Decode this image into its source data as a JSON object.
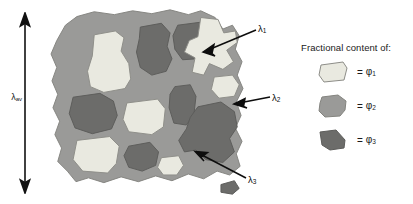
{
  "figure": {
    "type": "composite-microstructure-rve-diagram",
    "background_color": "#ffffff"
  },
  "scale_bar": {
    "name": "overall-length-scale",
    "label": "λ",
    "label_sub": "av",
    "orientation": "vertical",
    "arrowheads": "double"
  },
  "microstructure": {
    "matrix_label": "matrix-phase",
    "colors": {
      "matrix": "#9a9a98",
      "phase1_light": "#e9e9e0",
      "phase3_dark": "#6c6c6a",
      "outline": "#7f7f7d"
    },
    "outline_path": "M 22 20 L 34 11 L 52 6 L 73 9 L 92 5 L 112 8 L 131 4 L 150 9 L 163 5 L 178 12 L 186 24 L 196 20 L 203 31 L 199 45 L 206 58 L 201 72 L 207 86 L 200 100 L 205 114 L 199 127 L 206 141 L 200 154 L 204 167 L 193 176 L 180 172 L 166 180 L 150 175 L 133 182 L 116 177 L 98 183 L 80 178 L 62 184 L 46 179 L 33 183 L 24 172 L 14 162 L 18 148 L 11 134 L 16 120 L 9 106 L 14 92 L 8 78 L 13 64 L 7 50 L 13 36 Z",
    "inclusions": [
      {
        "name": "phase1-inclusion-top-left",
        "phase": 1,
        "path": "M 52 30 L 74 26 L 83 33 L 80 47 L 88 60 L 90 76 L 84 86 L 62 90 L 48 84 L 45 68 L 50 52 Z"
      },
      {
        "name": "phase3-inclusion-top-mid-left",
        "phase": 3,
        "path": "M 100 22 L 122 18 L 131 28 L 128 42 L 133 55 L 127 68 L 112 72 L 100 64 L 96 48 L 99 34 Z"
      },
      {
        "name": "phase3-inclusion-top-mid-right",
        "phase": 3,
        "path": "M 139 20 L 162 17 L 172 27 L 169 44 L 159 55 L 144 56 L 136 45 L 134 31 Z"
      },
      {
        "name": "phase1-inclusion-top-right-star",
        "phase": 1,
        "path": "M 163 12 L 181 14 L 187 28 L 199 26 L 201 38 L 190 46 L 197 58 L 186 66 L 172 60 L 166 72 L 154 69 L 157 54 L 146 48 L 151 36 L 160 32 Z"
      },
      {
        "name": "phase3-inclusion-mid-left",
        "phase": 3,
        "path": "M 30 95 L 58 91 L 72 99 L 76 114 L 70 128 L 50 133 L 32 127 L 26 112 Z"
      },
      {
        "name": "phase1-inclusion-mid-center",
        "phase": 1,
        "path": "M 86 101 L 118 97 L 126 107 L 124 126 L 112 134 L 88 131 L 82 118 Z"
      },
      {
        "name": "phase3-inclusion-mid-right",
        "phase": 3,
        "path": "M 136 84 L 152 82 L 158 94 L 156 112 L 148 124 L 135 122 L 130 106 L 131 92 Z"
      },
      {
        "name": "phase3-inclusion-large-bottom-right",
        "phase": 3,
        "path": "M 160 105 L 184 100 L 198 110 L 201 126 L 193 138 L 198 152 L 186 163 L 168 160 L 158 150 L 146 152 L 140 140 L 148 128 L 152 116 Z"
      },
      {
        "name": "phase1-inclusion-right-edge",
        "phase": 1,
        "path": "M 177 74 L 196 72 L 203 82 L 198 94 L 182 96 L 174 87 Z"
      },
      {
        "name": "phase1-inclusion-bottom-left",
        "phase": 1,
        "path": "M 34 140 L 68 136 L 78 146 L 75 164 L 66 174 L 40 172 L 30 160 Z"
      },
      {
        "name": "phase3-inclusion-bottom-center",
        "phase": 3,
        "path": "M 88 146 L 110 142 L 119 152 L 116 166 L 102 172 L 88 168 L 83 156 Z"
      },
      {
        "name": "phase1-inclusion-bottom-mid",
        "phase": 1,
        "path": "M 122 158 L 140 156 L 145 166 L 138 176 L 124 176 L 118 168 Z"
      },
      {
        "name": "phase3-inclusion-far-right-small",
        "phase": 3,
        "path": "M 184 186 L 198 182 L 203 190 L 196 196 L 184 194 Z"
      }
    ]
  },
  "callouts": [
    {
      "name": "callout-lambda-1",
      "label": "λ",
      "sub": "1",
      "points_to": "phase1-inclusion-top-right-star"
    },
    {
      "name": "callout-lambda-2",
      "label": "λ",
      "sub": "2",
      "points_to": "matrix"
    },
    {
      "name": "callout-lambda-3",
      "label": "λ",
      "sub": "3",
      "points_to": "phase3-inclusion-large-bottom-right"
    }
  ],
  "legend": {
    "title": "Fractional content of:",
    "equals": "=",
    "rows": [
      {
        "name": "legend-row-phi1",
        "symbol": "φ",
        "sub": "1",
        "color": "#e9e9e0",
        "swatch": "quadrilateral"
      },
      {
        "name": "legend-row-phi2",
        "symbol": "φ",
        "sub": "2",
        "color": "#9a9a98",
        "swatch": "blob"
      },
      {
        "name": "legend-row-phi3",
        "symbol": "φ",
        "sub": "3",
        "color": "#6c6c6a",
        "swatch": "wedge"
      }
    ]
  }
}
